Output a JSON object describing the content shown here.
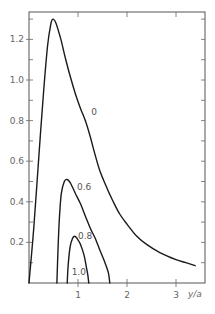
{
  "chart_data": {
    "type": "line",
    "title": "",
    "xlabel": "y/a",
    "ylabel": "",
    "xlim": [
      0,
      3.6
    ],
    "ylim": [
      0,
      1.32
    ],
    "grid": false,
    "legend": "inline curve labels",
    "x_ticks": [
      {
        "value": 1,
        "label": "1"
      },
      {
        "value": 2,
        "label": "2"
      },
      {
        "value": 3,
        "label": "3"
      }
    ],
    "y_ticks": [
      {
        "value": 0.2,
        "label": "0.2"
      },
      {
        "value": 0.4,
        "label": "0.4"
      },
      {
        "value": 0.6,
        "label": "0.6"
      },
      {
        "value": 0.8,
        "label": "0.8"
      },
      {
        "value": 1.0,
        "label": "1.0"
      },
      {
        "value": 1.2,
        "label": "1.2"
      }
    ],
    "series": [
      {
        "name": "0",
        "label_pos": {
          "x": 1.27,
          "y": 0.83
        },
        "points": [
          [
            0.0,
            0.0
          ],
          [
            0.1,
            0.28
          ],
          [
            0.2,
            0.62
          ],
          [
            0.3,
            0.95
          ],
          [
            0.38,
            1.17
          ],
          [
            0.45,
            1.28
          ],
          [
            0.49,
            1.3
          ],
          [
            0.55,
            1.28
          ],
          [
            0.65,
            1.2
          ],
          [
            0.75,
            1.1
          ],
          [
            0.85,
            1.01
          ],
          [
            0.95,
            0.93
          ],
          [
            1.05,
            0.86
          ],
          [
            1.15,
            0.8
          ],
          [
            1.25,
            0.72
          ],
          [
            1.35,
            0.63
          ],
          [
            1.45,
            0.55
          ],
          [
            1.55,
            0.49
          ],
          [
            1.7,
            0.41
          ],
          [
            1.85,
            0.34
          ],
          [
            2.0,
            0.29
          ],
          [
            2.2,
            0.23
          ],
          [
            2.4,
            0.19
          ],
          [
            2.67,
            0.15
          ],
          [
            3.0,
            0.115
          ],
          [
            3.2,
            0.1
          ],
          [
            3.39,
            0.085
          ]
        ]
      },
      {
        "name": "0.6",
        "label_pos": {
          "x": 0.98,
          "y": 0.46
        },
        "points": [
          [
            0.57,
            0.0
          ],
          [
            0.59,
            0.15
          ],
          [
            0.62,
            0.32
          ],
          [
            0.66,
            0.44
          ],
          [
            0.72,
            0.5
          ],
          [
            0.78,
            0.51
          ],
          [
            0.85,
            0.49
          ],
          [
            0.95,
            0.44
          ],
          [
            1.05,
            0.39
          ],
          [
            1.15,
            0.33
          ],
          [
            1.25,
            0.27
          ],
          [
            1.35,
            0.22
          ],
          [
            1.45,
            0.16
          ],
          [
            1.55,
            0.1
          ],
          [
            1.62,
            0.05
          ],
          [
            1.65,
            0.0
          ]
        ]
      },
      {
        "name": "0.8",
        "label_pos": {
          "x": 1.0,
          "y": 0.215
        },
        "points": [
          [
            0.78,
            0.0
          ],
          [
            0.8,
            0.09
          ],
          [
            0.84,
            0.18
          ],
          [
            0.89,
            0.22
          ],
          [
            0.93,
            0.23
          ],
          [
            0.98,
            0.22
          ],
          [
            1.05,
            0.19
          ],
          [
            1.12,
            0.14
          ],
          [
            1.17,
            0.08
          ],
          [
            1.2,
            0.04
          ],
          [
            1.22,
            0.0
          ]
        ]
      },
      {
        "name": "1.0",
        "label_pos": {
          "x": 0.87,
          "y": 0.04
        },
        "points": []
      }
    ]
  }
}
